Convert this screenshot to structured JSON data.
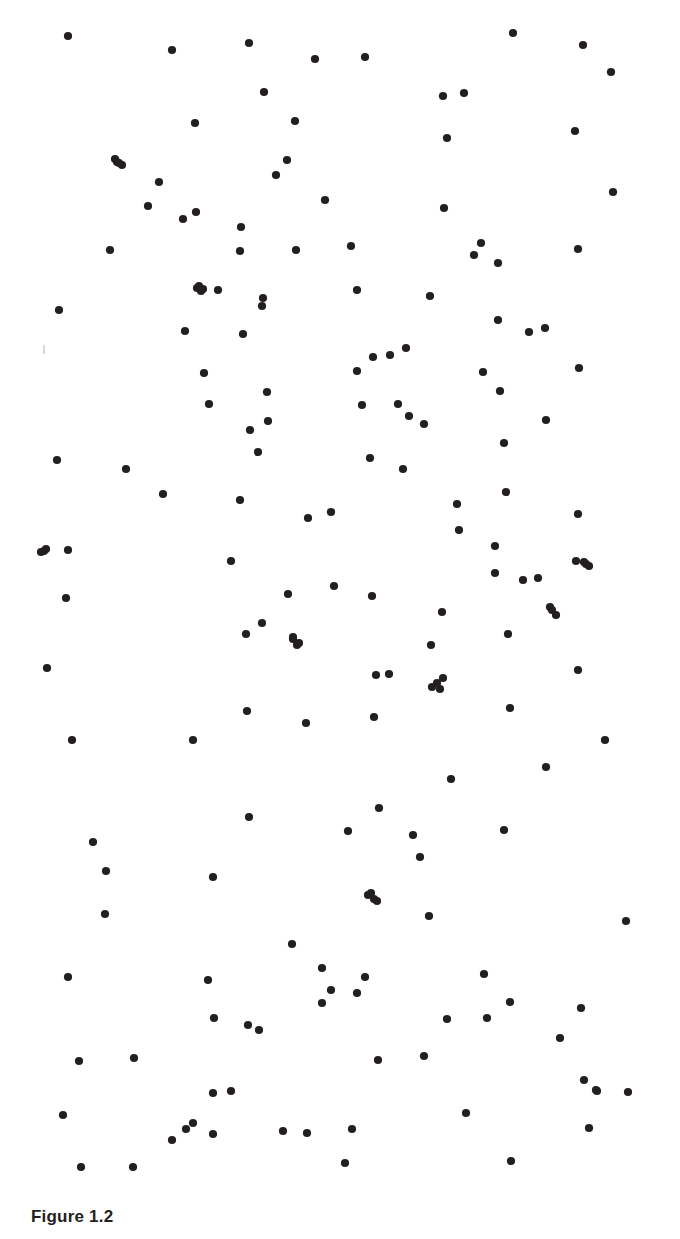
{
  "figure": {
    "caption": "Figure 1.2",
    "dot_color": "#231f20",
    "background_color": "#ffffff",
    "dot_radius": 4.1,
    "point_count": 181
  },
  "artifact": {
    "name": "stray-speck",
    "x": 43,
    "y": 345,
    "color": "#d8d8d8"
  },
  "chart_data": {
    "type": "scatter",
    "title": "Figure 1.2",
    "xlabel": "",
    "ylabel": "",
    "xlim": [
      0,
      680
    ],
    "ylim": [
      0,
      1185
    ],
    "grid": false,
    "legend": null,
    "marker": "filled-circle",
    "marker_color": "#231f20",
    "marker_size": 8.2,
    "series": [
      {
        "name": "random-point-pattern",
        "points": [
          [
            68,
            36
          ],
          [
            172,
            50
          ],
          [
            249,
            43
          ],
          [
            315,
            59
          ],
          [
            365,
            57
          ],
          [
            513,
            33
          ],
          [
            583,
            45
          ],
          [
            611,
            72
          ],
          [
            443,
            96
          ],
          [
            464,
            93
          ],
          [
            264,
            92
          ],
          [
            195,
            123
          ],
          [
            295,
            121
          ],
          [
            575,
            131
          ],
          [
            447,
            138
          ],
          [
            117,
            162
          ],
          [
            122,
            165
          ],
          [
            159,
            182
          ],
          [
            276,
            175
          ],
          [
            287,
            160
          ],
          [
            613,
            192
          ],
          [
            148,
            206
          ],
          [
            183,
            219
          ],
          [
            196,
            212
          ],
          [
            325,
            200
          ],
          [
            444,
            208
          ],
          [
            241,
            227
          ],
          [
            481,
            243
          ],
          [
            110,
            250
          ],
          [
            240,
            251
          ],
          [
            296,
            250
          ],
          [
            351,
            246
          ],
          [
            578,
            249
          ],
          [
            474,
            255
          ],
          [
            498,
            263
          ],
          [
            197,
            288
          ],
          [
            203,
            289
          ],
          [
            218,
            290
          ],
          [
            357,
            290
          ],
          [
            263,
            298
          ],
          [
            262,
            306
          ],
          [
            430,
            296
          ],
          [
            59,
            310
          ],
          [
            185,
            331
          ],
          [
            243,
            334
          ],
          [
            529,
            332
          ],
          [
            545,
            328
          ],
          [
            498,
            320
          ],
          [
            373,
            357
          ],
          [
            390,
            355
          ],
          [
            406,
            348
          ],
          [
            204,
            373
          ],
          [
            267,
            392
          ],
          [
            357,
            371
          ],
          [
            483,
            372
          ],
          [
            500,
            391
          ],
          [
            579,
            368
          ],
          [
            209,
            404
          ],
          [
            268,
            421
          ],
          [
            362,
            405
          ],
          [
            398,
            404
          ],
          [
            409,
            416
          ],
          [
            424,
            424
          ],
          [
            546,
            420
          ],
          [
            250,
            430
          ],
          [
            258,
            452
          ],
          [
            370,
            458
          ],
          [
            403,
            469
          ],
          [
            504,
            443
          ],
          [
            57,
            460
          ],
          [
            126,
            469
          ],
          [
            163,
            494
          ],
          [
            240,
            500
          ],
          [
            308,
            518
          ],
          [
            331,
            512
          ],
          [
            457,
            504
          ],
          [
            506,
            492
          ],
          [
            578,
            514
          ],
          [
            459,
            530
          ],
          [
            44,
            551
          ],
          [
            68,
            550
          ],
          [
            231,
            561
          ],
          [
            495,
            546
          ],
          [
            576,
            561
          ],
          [
            586,
            564
          ],
          [
            288,
            594
          ],
          [
            334,
            586
          ],
          [
            372,
            596
          ],
          [
            495,
            573
          ],
          [
            523,
            580
          ],
          [
            538,
            578
          ],
          [
            66,
            598
          ],
          [
            442,
            612
          ],
          [
            246,
            634
          ],
          [
            262,
            623
          ],
          [
            293,
            639
          ],
          [
            299,
            643
          ],
          [
            550,
            607
          ],
          [
            431,
            645
          ],
          [
            508,
            634
          ],
          [
            47,
            668
          ],
          [
            376,
            675
          ],
          [
            389,
            674
          ],
          [
            432,
            687
          ],
          [
            443,
            678
          ],
          [
            578,
            670
          ],
          [
            247,
            711
          ],
          [
            306,
            723
          ],
          [
            374,
            717
          ],
          [
            510,
            708
          ],
          [
            72,
            740
          ],
          [
            193,
            740
          ],
          [
            546,
            767
          ],
          [
            605,
            740
          ],
          [
            451,
            779
          ],
          [
            249,
            817
          ],
          [
            379,
            808
          ],
          [
            348,
            831
          ],
          [
            413,
            835
          ],
          [
            420,
            857
          ],
          [
            504,
            830
          ],
          [
            93,
            842
          ],
          [
            106,
            871
          ],
          [
            105,
            914
          ],
          [
            213,
            877
          ],
          [
            368,
            895
          ],
          [
            374,
            899
          ],
          [
            429,
            916
          ],
          [
            626,
            921
          ],
          [
            292,
            944
          ],
          [
            68,
            977
          ],
          [
            208,
            980
          ],
          [
            322,
            968
          ],
          [
            331,
            990
          ],
          [
            357,
            993
          ],
          [
            365,
            977
          ],
          [
            484,
            974
          ],
          [
            214,
            1018
          ],
          [
            259,
            1030
          ],
          [
            487,
            1018
          ],
          [
            560,
            1038
          ],
          [
            581,
            1008
          ],
          [
            79,
            1061
          ],
          [
            134,
            1058
          ],
          [
            378,
            1060
          ],
          [
            584,
            1080
          ],
          [
            213,
            1093
          ],
          [
            231,
            1091
          ],
          [
            193,
            1123
          ],
          [
            213,
            1134
          ],
          [
            283,
            1131
          ],
          [
            352,
            1129
          ],
          [
            597,
            1091
          ],
          [
            63,
            1115
          ],
          [
            589,
            1128
          ],
          [
            81,
            1167
          ],
          [
            133,
            1167
          ],
          [
            511,
            1161
          ],
          [
            322,
            1003
          ],
          [
            424,
            1056
          ],
          [
            447,
            1019
          ],
          [
            510,
            1002
          ],
          [
            466,
            1113
          ],
          [
            115,
            159
          ],
          [
            119,
            163
          ],
          [
            199,
            286
          ],
          [
            201,
            291
          ],
          [
            293,
            637
          ],
          [
            297,
            645
          ],
          [
            371,
            893
          ],
          [
            377,
            901
          ],
          [
            584,
            562
          ],
          [
            589,
            566
          ],
          [
            41,
            552
          ],
          [
            46,
            549
          ],
          [
            628,
            1092
          ],
          [
            596,
            1090
          ],
          [
            172,
            1140
          ],
          [
            186,
            1129
          ],
          [
            248,
            1025
          ],
          [
            440,
            689
          ],
          [
            437,
            683
          ],
          [
            556,
            615
          ],
          [
            552,
            610
          ],
          [
            345,
            1163
          ],
          [
            307,
            1133
          ]
        ]
      }
    ]
  }
}
